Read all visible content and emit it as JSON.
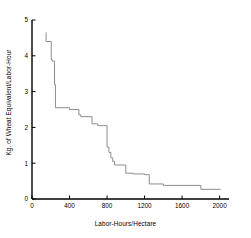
{
  "chart_data": {
    "type": "line",
    "title": "",
    "xlabel": "Labor-Hours/Hectare",
    "ylabel": "Kg. of Wheat Equivalent/Labor-Hour",
    "xlim": [
      0,
      2100
    ],
    "ylim": [
      0,
      5
    ],
    "xticks": [
      0,
      400,
      800,
      1200,
      1600,
      2000
    ],
    "xtick_labels": [
      "0",
      "400",
      "800",
      "1200",
      "1600",
      "2000"
    ],
    "yticks": [
      0,
      1,
      2,
      3,
      4,
      5
    ],
    "ytick_labels": [
      "0",
      "1",
      "2",
      "3",
      "4",
      "5"
    ],
    "grid": false,
    "legend": null,
    "series": [
      {
        "name": "wheat-equivalent-step",
        "drawstyle": "steps-post",
        "color": "#808080",
        "linewidth": 0.9,
        "x": [
          150,
          150,
          205,
          205,
          215,
          215,
          240,
          240,
          250,
          250,
          400,
          400,
          500,
          500,
          520,
          520,
          640,
          640,
          700,
          700,
          760,
          760,
          800,
          800,
          820,
          820,
          840,
          840,
          860,
          860,
          880,
          880,
          900,
          900,
          1000,
          1000,
          1080,
          1080,
          1200,
          1200,
          1250,
          1250,
          1400,
          1400,
          1800,
          1800,
          2010
        ],
        "y": [
          4.65,
          4.4,
          4.4,
          3.9,
          3.9,
          3.85,
          3.85,
          3.2,
          3.2,
          2.55,
          2.55,
          2.5,
          2.5,
          2.35,
          2.35,
          2.3,
          2.3,
          2.1,
          2.1,
          2.05,
          2.05,
          2.05,
          2.05,
          1.45,
          1.45,
          1.3,
          1.3,
          1.15,
          1.15,
          1.05,
          1.05,
          0.95,
          0.95,
          0.95,
          0.95,
          0.72,
          0.72,
          0.7,
          0.7,
          0.68,
          0.68,
          0.42,
          0.42,
          0.38,
          0.38,
          0.27,
          0.27
        ]
      }
    ]
  },
  "axes": {
    "x_axis_name": "x-axis",
    "y_axis_name": "y-axis"
  }
}
